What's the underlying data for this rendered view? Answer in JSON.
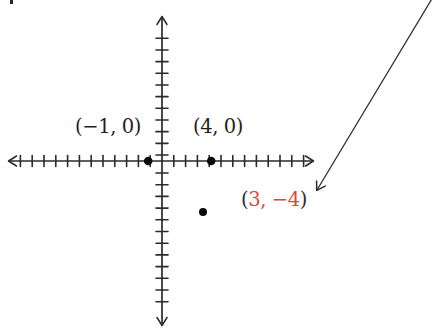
{
  "canvas": {
    "background": "#ffffff",
    "ink_color": "#2b2b2b"
  },
  "chart_data": {
    "type": "scatter",
    "title": "",
    "xlabel": "",
    "ylabel": "",
    "xlim": [
      -12,
      13
    ],
    "ylim": [
      -14,
      12
    ],
    "grid": false,
    "axes_style": "hand-drawn coordinate plane, arrowheads on all four axis ends, unit tick marks, no numeric tick labels",
    "points": [
      {
        "x": -1,
        "y": 0,
        "label_open": "(",
        "label_inner": "−1, 0",
        "label_close": ")",
        "paren_color": "#1f1f1f",
        "number_color": "#1f1f1f",
        "dot_color": "#0a0a0a"
      },
      {
        "x": 4,
        "y": 0,
        "label_open": "(",
        "label_inner": "4, 0",
        "label_close": ")",
        "paren_color": "#1f1f1f",
        "number_color": "#1f1f1f",
        "dot_color": "#0a0a0a"
      },
      {
        "x": 3,
        "y": -4,
        "label_open": "(",
        "label_inner": "3, −4",
        "label_close": ")",
        "paren_color": "#2e2e2e",
        "number_color": "#d64a3a",
        "dot_color": "#0a0a0a"
      }
    ],
    "annotations": [
      {
        "kind": "arrow",
        "description": "long straight arrow entering from the top-right corner, pointing down-left toward the (3, −4) label",
        "color": "#2b2b2b"
      }
    ]
  }
}
